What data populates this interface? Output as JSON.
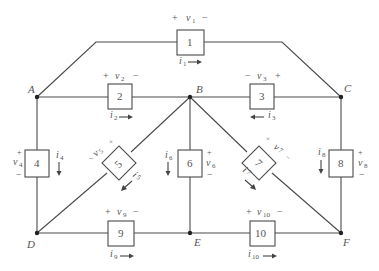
{
  "diagram": {
    "type": "circuit-network",
    "nodes": [
      {
        "id": "A",
        "label": "A"
      },
      {
        "id": "B",
        "label": "B"
      },
      {
        "id": "C",
        "label": "C"
      },
      {
        "id": "D",
        "label": "D"
      },
      {
        "id": "E",
        "label": "E"
      },
      {
        "id": "F",
        "label": "F"
      }
    ],
    "elements": [
      {
        "id": "1",
        "label": "1",
        "from": "A",
        "to": "C",
        "voltage": "v1",
        "current": "i1",
        "v_plus": "+",
        "v_minus": "−",
        "current_dir": "right"
      },
      {
        "id": "2",
        "label": "2",
        "from": "A",
        "to": "B",
        "voltage": "v2",
        "current": "i2",
        "v_plus": "+",
        "v_minus": "−",
        "current_dir": "right"
      },
      {
        "id": "3",
        "label": "3",
        "from": "B",
        "to": "C",
        "voltage": "v3",
        "current": "i3",
        "v_plus": "+",
        "v_minus": "−",
        "current_dir": "left"
      },
      {
        "id": "4",
        "label": "4",
        "from": "A",
        "to": "D",
        "voltage": "v4",
        "current": "i4",
        "v_plus": "+",
        "v_minus": "−",
        "current_dir": "down"
      },
      {
        "id": "5",
        "label": "5",
        "from": "B",
        "to": "D",
        "voltage": "v5",
        "current": "i5",
        "v_plus": "+",
        "v_minus": "−",
        "current_dir": "down-left"
      },
      {
        "id": "6",
        "label": "6",
        "from": "B",
        "to": "E",
        "voltage": "v6",
        "current": "i6",
        "v_plus": "+",
        "v_minus": "−",
        "current_dir": "down"
      },
      {
        "id": "7",
        "label": "7",
        "from": "B",
        "to": "F",
        "voltage": "v7",
        "current": "i7",
        "v_plus": "+",
        "v_minus": "−",
        "current_dir": "down-right"
      },
      {
        "id": "8",
        "label": "8",
        "from": "C",
        "to": "F",
        "voltage": "v8",
        "current": "i8",
        "v_plus": "+",
        "v_minus": "−",
        "current_dir": "down"
      },
      {
        "id": "9",
        "label": "9",
        "from": "D",
        "to": "E",
        "voltage": "v9",
        "current": "i9",
        "v_plus": "+",
        "v_minus": "−",
        "current_dir": "right"
      },
      {
        "id": "10",
        "label": "10",
        "from": "E",
        "to": "F",
        "voltage": "v10",
        "current": "i10",
        "v_plus": "+",
        "v_minus": "−",
        "current_dir": "right"
      }
    ],
    "labels": {
      "v1": "v",
      "v1_sub": "1",
      "i1": "i",
      "i1_sub": "1",
      "v2": "v",
      "v2_sub": "2",
      "i2": "i",
      "i2_sub": "2",
      "v3": "v",
      "v3_sub": "3",
      "i3": "i",
      "i3_sub": "3",
      "v4": "v",
      "v4_sub": "4",
      "i4": "i",
      "i4_sub": "4",
      "v5": "v",
      "v5_sub": "5",
      "i5": "i",
      "i5_sub": "5",
      "v6": "v",
      "v6_sub": "6",
      "i6": "i",
      "i6_sub": "6",
      "v7": "v",
      "v7_sub": "7",
      "i7": "i",
      "i7_sub": "7",
      "v8": "v",
      "v8_sub": "8",
      "i8": "i",
      "i8_sub": "8",
      "v9": "v",
      "v9_sub": "9",
      "i9": "i",
      "i9_sub": "9",
      "v10": "v",
      "v10_sub": "10",
      "i10": "i",
      "i10_sub": "10",
      "plus": "+",
      "minus": "−"
    }
  }
}
